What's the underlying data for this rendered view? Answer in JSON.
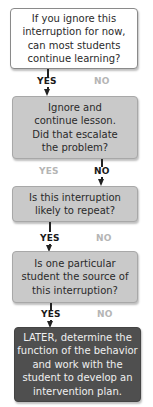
{
  "flowchart": {
    "nodes": [
      {
        "id": "q1",
        "text": "If you ignore this\ninterruption for now,\ncan most students\ncontinue learning?",
        "style": "white"
      },
      {
        "id": "q2",
        "text": "Ignore and\ncontinue lesson.\nDid that escalate\nthe problem?",
        "style": "grey"
      },
      {
        "id": "q3",
        "text": "Is this interruption\nlikely to repeat?",
        "style": "grey"
      },
      {
        "id": "q4",
        "text": "Is one particular\nstudent the source of\nthis interruption?",
        "style": "grey"
      },
      {
        "id": "a1",
        "text": "LATER, determine the\nfunction of the behavior\nand work with the\nstudent to develop an\nintervention plan.",
        "style": "dark"
      }
    ],
    "branches": [
      {
        "from": "q1",
        "yes": "YES",
        "no": "NO",
        "active": "yes"
      },
      {
        "from": "q2",
        "yes": "YES",
        "no": "NO",
        "active": "no"
      },
      {
        "from": "q3",
        "yes": "YES",
        "no": "NO",
        "active": "yes"
      },
      {
        "from": "q4",
        "yes": "YES",
        "no": "NO",
        "active": "yes"
      }
    ]
  },
  "colors": {
    "white_box": "#ffffff",
    "grey_box": "#c9c9c9",
    "dark_box": "#4f4f4f",
    "active_label": "#1a1a1a",
    "inactive_label": "#b5b5b5"
  }
}
